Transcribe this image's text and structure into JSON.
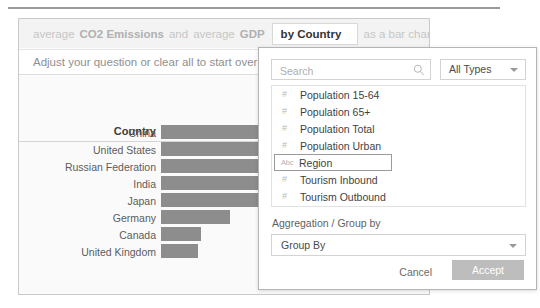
{
  "question_bar": {
    "tokens": [
      {
        "text": "average",
        "style": "light"
      },
      {
        "text": "CO2 Emissions",
        "style": "bold"
      },
      {
        "text": "and",
        "style": "light"
      },
      {
        "text": "average",
        "style": "light"
      },
      {
        "text": "GDP",
        "style": "bold"
      }
    ],
    "active_chip": "by Country",
    "trailing": "as a bar chart"
  },
  "adjust_bar": {
    "text": "Adjust your question or clear all to start over"
  },
  "modal": {
    "search": {
      "placeholder": "Search",
      "value": "",
      "icon": "search-icon"
    },
    "type_filter": {
      "value": "All Types",
      "icon": "chevron-down-icon"
    },
    "fields": [
      {
        "name": "Population 15-64",
        "type_icon": "#",
        "selected": false
      },
      {
        "name": "Population 65+",
        "type_icon": "#",
        "selected": false
      },
      {
        "name": "Population Total",
        "type_icon": "#",
        "selected": false
      },
      {
        "name": "Population Urban",
        "type_icon": "#",
        "selected": false
      },
      {
        "name": "Region",
        "type_icon": "Abc",
        "selected": true
      },
      {
        "name": "Tourism Inbound",
        "type_icon": "#",
        "selected": false
      },
      {
        "name": "Tourism Outbound",
        "type_icon": "#",
        "selected": false
      }
    ],
    "aggregation": {
      "label": "Aggregation / Group by",
      "value": "Group By",
      "icon": "chevron-down-icon"
    },
    "buttons": {
      "cancel": "Cancel",
      "accept": "Accept"
    }
  },
  "chart_data": {
    "type": "bar",
    "title": "",
    "xlabel": "",
    "ylabel": "Country",
    "categories": [
      "China",
      "United States",
      "Russian Federation",
      "India",
      "Japan",
      "Germany",
      "Canada",
      "United Kingdom"
    ],
    "values": [
      100,
      97,
      62,
      55,
      44,
      28,
      16,
      15
    ],
    "ylim": [
      0,
      100
    ],
    "grid": false,
    "legend": "none",
    "bar_color": "#8d8d8d",
    "orientation": "horizontal"
  },
  "colors": {
    "bar": "#8d8d8d",
    "accent_button": "#bdbdbd",
    "card_border": "#c9c9c9",
    "modal_border": "#b4b4b4"
  }
}
